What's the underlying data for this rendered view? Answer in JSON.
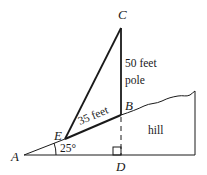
{
  "diagram": {
    "type": "geometry",
    "points": {
      "A": {
        "label": "A",
        "x": 24,
        "y": 155
      },
      "E": {
        "label": "E",
        "x": 65,
        "y": 139
      },
      "B": {
        "label": "B",
        "x": 121,
        "y": 115
      },
      "C": {
        "label": "C",
        "x": 121,
        "y": 28
      },
      "D": {
        "label": "D",
        "x": 121,
        "y": 155
      }
    },
    "labels": {
      "pole_length": "50 feet",
      "pole_word": "pole",
      "segment_EB": "35 feet",
      "angle_A": "25°",
      "hill": "hill"
    },
    "colors": {
      "line": "#1a1a1a",
      "background": "#ffffff"
    }
  }
}
